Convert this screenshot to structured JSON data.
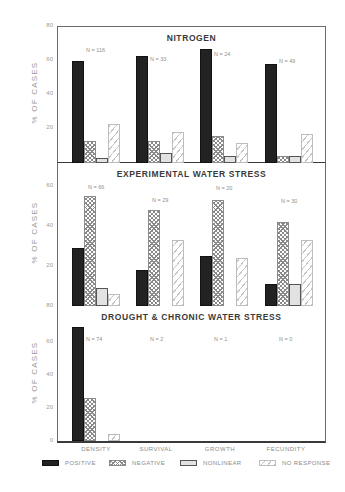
{
  "chart_data": [
    {
      "type": "bar",
      "title": "NITROGEN",
      "xlabel": "",
      "ylabel": "% OF CASES",
      "ylim": [
        0,
        80
      ],
      "yticks": [
        20,
        40,
        60,
        80
      ],
      "categories": [
        "DENSITY",
        "SURVIVAL",
        "GROWTH",
        "FECUNDITY"
      ],
      "n_labels": [
        "N = 116",
        "N = 33",
        "N = 24",
        "N = 49"
      ],
      "series": [
        {
          "name": "POSITIVE",
          "values": [
            60,
            63,
            67,
            58
          ]
        },
        {
          "name": "NEGATIVE",
          "values": [
            13,
            13,
            16,
            4
          ]
        },
        {
          "name": "NONLINEAR",
          "values": [
            3,
            6,
            4,
            4
          ]
        },
        {
          "name": "NO RESPONSE",
          "values": [
            23,
            18,
            12,
            17
          ]
        }
      ]
    },
    {
      "type": "bar",
      "title": "EXPERIMENTAL WATER STRESS",
      "xlabel": "",
      "ylabel": "% OF CASES",
      "ylim": [
        0,
        80
      ],
      "yticks": [
        20,
        40,
        60,
        80
      ],
      "categories": [
        "DENSITY",
        "SURVIVAL",
        "GROWTH",
        "FECUNDITY"
      ],
      "n_labels": [
        "N = 66",
        "N = 29",
        "N = 20",
        "N = 30"
      ],
      "series": [
        {
          "name": "POSITIVE",
          "values": [
            29,
            18,
            25,
            11
          ]
        },
        {
          "name": "NEGATIVE",
          "values": [
            55,
            48,
            53,
            42
          ]
        },
        {
          "name": "NONLINEAR",
          "values": [
            9,
            0,
            0,
            11
          ]
        },
        {
          "name": "NO RESPONSE",
          "values": [
            6,
            33,
            24,
            33
          ]
        }
      ]
    },
    {
      "type": "bar",
      "title": "DROUGHT & CHRONIC WATER STRESS",
      "xlabel": "",
      "ylabel": "% OF CASES",
      "ylim": [
        0,
        80
      ],
      "yticks": [
        0,
        20,
        40,
        60,
        80
      ],
      "categories": [
        "DENSITY",
        "SURVIVAL",
        "GROWTH",
        "FECUNDITY"
      ],
      "n_labels": [
        "N = 74",
        "N = 2",
        "N = 1",
        "N = 0"
      ],
      "series": [
        {
          "name": "POSITIVE",
          "values": [
            68,
            0,
            0,
            0
          ]
        },
        {
          "name": "NEGATIVE",
          "values": [
            26,
            0,
            0,
            0
          ]
        },
        {
          "name": "NONLINEAR",
          "values": [
            0,
            0,
            0,
            0
          ]
        },
        {
          "name": "NO RESPONSE",
          "values": [
            4,
            0,
            0,
            0
          ]
        }
      ]
    }
  ],
  "legend": {
    "position": "bottom",
    "items": [
      {
        "label": "POSITIVE",
        "pattern": "solid-dark"
      },
      {
        "label": "NEGATIVE",
        "pattern": "crosshatch"
      },
      {
        "label": "NONLINEAR",
        "pattern": "light-gray"
      },
      {
        "label": "NO RESPONSE",
        "pattern": "diagonal-lines"
      }
    ]
  },
  "axis": {
    "ylabel": "% OF CASES",
    "categories": [
      "DENSITY",
      "SURVIVAL",
      "GROWTH",
      "FECUNDITY"
    ]
  },
  "colors": {
    "positive": "#222222",
    "negative_hatch": "#8a8a8a",
    "nonlinear": "#e2e2e2",
    "no_response_hatch": "#c4c4c4",
    "frame": "#3a3a3a"
  }
}
